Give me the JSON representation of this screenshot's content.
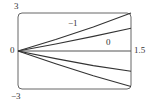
{
  "chart_data": {
    "type": "line",
    "title": "",
    "xlabel": "",
    "ylabel": "",
    "xlim": [
      0,
      1.5
    ],
    "ylim": [
      -3,
      3
    ],
    "grid": false,
    "legend": null,
    "tick_labels": {
      "y_top": "3",
      "y_bottom": "−3",
      "origin": "0",
      "x_right": "1.5"
    },
    "annotations": [
      {
        "text": "−1",
        "x": 0.85,
        "y": 2.1
      },
      {
        "text": "0",
        "x": 1.2,
        "y": 0.6
      }
    ],
    "series": [
      {
        "name": "curve-1",
        "x": [
          0,
          0.5,
          1.0,
          1.5
        ],
        "y": [
          0,
          0.9,
          1.9,
          3.0
        ]
      },
      {
        "name": "curve-2",
        "x": [
          0,
          0.5,
          1.0,
          1.5
        ],
        "y": [
          0,
          0.55,
          1.15,
          1.8
        ]
      },
      {
        "name": "axis-0",
        "x": [
          0,
          1.5
        ],
        "y": [
          0,
          0
        ]
      },
      {
        "name": "curve-4",
        "x": [
          0,
          0.5,
          1.0,
          1.5
        ],
        "y": [
          0,
          -0.6,
          -1.15,
          -1.6
        ]
      },
      {
        "name": "curve-5",
        "x": [
          0,
          0.5,
          1.0,
          1.5
        ],
        "y": [
          0,
          -1.0,
          -1.95,
          -2.8
        ]
      }
    ]
  },
  "colors": {
    "frame": "#555555",
    "curve": "#333333",
    "text": "#333333"
  }
}
